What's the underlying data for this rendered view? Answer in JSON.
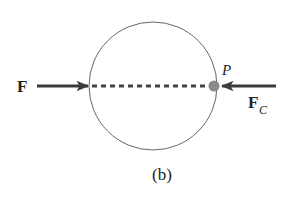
{
  "diagram": {
    "caption": "(b)",
    "forces": [
      {
        "id": "applied",
        "label": "F",
        "subscript": "",
        "direction": "rightward"
      },
      {
        "id": "contact",
        "label": "F",
        "subscript": "C",
        "direction": "leftward"
      }
    ],
    "point": {
      "label": "P"
    },
    "body": "circle",
    "line_of_action": "dashed"
  },
  "colors": {
    "stroke": "#555555",
    "arrow": "#3a3a3a",
    "dot": "#8a8a8a",
    "text": "#222222"
  }
}
